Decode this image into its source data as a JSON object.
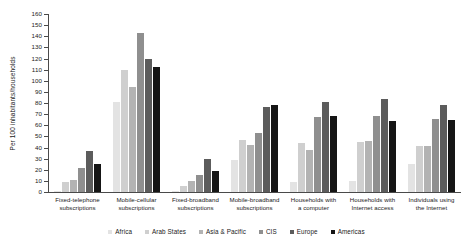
{
  "chart_data": {
    "type": "bar",
    "title": "",
    "subtitle": "",
    "xlabel": "",
    "ylabel": "Per 100 inhabitants/households",
    "ylim": [
      0,
      160
    ],
    "ytick_step": 10,
    "yticks": [
      0,
      10,
      20,
      30,
      40,
      50,
      60,
      70,
      80,
      90,
      100,
      110,
      120,
      130,
      140,
      150,
      160
    ],
    "grid": false,
    "legend_position": "bottom",
    "categories": [
      "Fixed-telephone subscriptions",
      "Mobile-cellular subscriptions",
      "Fixed-broadband subscriptions",
      "Mobile-broadband subscriptions",
      "Households with a computer",
      "Households with Internet access",
      "Individuals using the Internet"
    ],
    "categories_lines": [
      [
        "Fixed-telephone",
        "subscriptions"
      ],
      [
        "Mobile-cellular",
        "subscriptions"
      ],
      [
        "Fixed-broadband",
        "subscriptions"
      ],
      [
        "Mobile-broadband",
        "subscriptions"
      ],
      [
        "Households with",
        "a computer"
      ],
      [
        "Households with",
        "Internet access"
      ],
      [
        "Individuals using",
        "the Internet"
      ]
    ],
    "series": [
      {
        "name": "Africa",
        "color": "#e3e3e3",
        "values": [
          1,
          81,
          0.5,
          29,
          9,
          10,
          25
        ]
      },
      {
        "name": "Arab States",
        "color": "#cfcfcf",
        "values": [
          9,
          110,
          5,
          47,
          44,
          45,
          41
        ]
      },
      {
        "name": "Asia & Pacific",
        "color": "#b3b3b3",
        "values": [
          11,
          94,
          10,
          42,
          38,
          46,
          41
        ]
      },
      {
        "name": "CIS",
        "color": "#8f8f8f",
        "values": [
          22,
          143,
          15,
          53,
          67,
          68,
          66
        ]
      },
      {
        "name": "Europe",
        "color": "#5c5c5c",
        "values": [
          37,
          120,
          30,
          76,
          81,
          84,
          78
        ]
      },
      {
        "name": "Americas",
        "color": "#151515",
        "values": [
          25,
          112,
          19,
          78,
          68,
          64,
          65
        ]
      }
    ]
  }
}
